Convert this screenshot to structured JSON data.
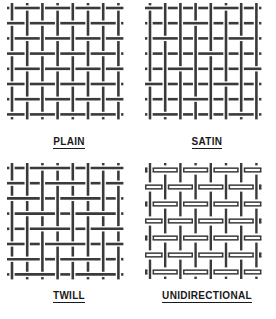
{
  "figure": {
    "background_color": "#ffffff",
    "thread_color": "#3a3a3a",
    "label_color": "#1a1a1a"
  },
  "weaves": [
    {
      "id": "plain",
      "label": "PLAIN",
      "pattern": "plain",
      "description": "Alternating over-under checkerboard weave",
      "columns": 8,
      "rows": 8
    },
    {
      "id": "satin",
      "label": "SATIN",
      "pattern": "satin",
      "description": "Long warp floats with sparse interlacing",
      "columns": 8,
      "rows": 8
    },
    {
      "id": "twill",
      "label": "TWILL",
      "pattern": "twill",
      "description": "Staggered diagonal two-by-two interlacing",
      "columns": 8,
      "rows": 8
    },
    {
      "id": "unidirectional",
      "label": "UNIDIRECTIONAL",
      "pattern": "unidirectional",
      "description": "Heavy horizontal tows held by fine vertical threads",
      "columns": 8,
      "rows": 7
    }
  ]
}
